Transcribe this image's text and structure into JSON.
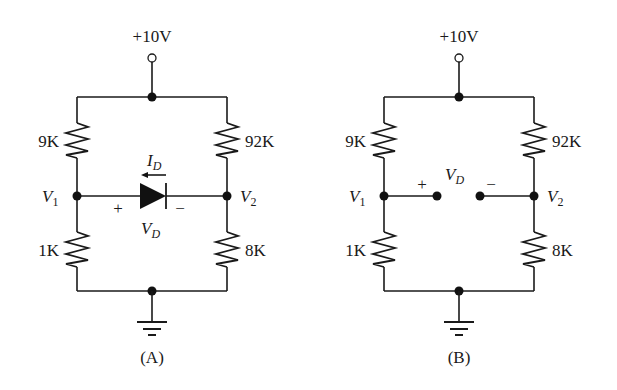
{
  "figure": {
    "caption_a": "(A)",
    "caption_b": "(B)"
  },
  "circuit_a": {
    "supply_label": "+10V",
    "r_top_left": "9K",
    "r_top_right": "92K",
    "r_bottom_left": "1K",
    "r_bottom_right": "8K",
    "node_left": {
      "main": "V",
      "sub": "1"
    },
    "node_right": {
      "main": "V",
      "sub": "2"
    },
    "current": {
      "main": "I",
      "sub": "D"
    },
    "diode_voltage": {
      "main": "V",
      "sub": "D"
    },
    "plus_sign": "+",
    "minus_sign": "−"
  },
  "circuit_b": {
    "supply_label": "+10V",
    "r_top_left": "9K",
    "r_top_right": "92K",
    "r_bottom_left": "1K",
    "r_bottom_right": "8K",
    "node_left": {
      "main": "V",
      "sub": "1"
    },
    "node_right": {
      "main": "V",
      "sub": "2"
    },
    "open_voltage": {
      "main": "V",
      "sub": "D"
    },
    "plus_sign": "+",
    "minus_sign": "−"
  },
  "colors": {
    "ink": "#1a1a1a",
    "background": "#ffffff"
  }
}
